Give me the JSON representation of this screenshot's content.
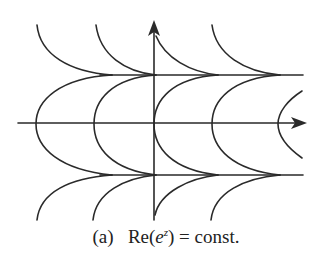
{
  "figure": {
    "label": "(a)",
    "caption_prefix": "Re(",
    "caption_base": "e",
    "caption_exp": "z",
    "caption_suffix": ") = const.",
    "stroke_color": "#2a2a2a",
    "background": "#ffffff"
  },
  "axes": {
    "x_axis": {
      "y": 123,
      "x_start": 18,
      "x_end": 306
    },
    "y_axis": {
      "x": 154,
      "y_start": 220,
      "y_end": 20
    }
  },
  "curves": {
    "horizontal_lines_y": [
      75,
      175
    ],
    "parabola_vertices_x": [
      36,
      94,
      154,
      212,
      278
    ],
    "description": "Level curves of Re(e^z): arcs converging on asymptotic horizontal lines Im z = ±π/2"
  }
}
